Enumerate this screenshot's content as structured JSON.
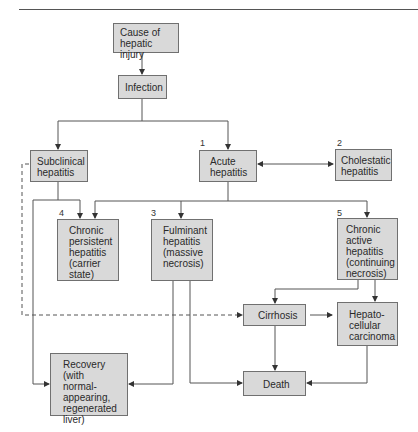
{
  "diagram": {
    "type": "flowchart",
    "colors": {
      "box_fill": "#d9d9d9",
      "box_border": "#707070",
      "line": "#555555"
    },
    "nodes": {
      "cause": {
        "label": "Cause of\nhepatic injury"
      },
      "infection": {
        "label": "Infection"
      },
      "subclinical": {
        "label": "Subclinical\nhepatitis"
      },
      "acute": {
        "label": "Acute\nhepatitis",
        "number": "1"
      },
      "cholestatic": {
        "label": "Cholestatic\nhepatitis",
        "number": "2"
      },
      "fulminant": {
        "label": "Fulminant\nhepatitis\n(massive\nnecrosis)",
        "number": "3"
      },
      "chronic_persistent": {
        "label": "Chronic\npersistent\nhepatitis\n(carrier\nstate)",
        "number": "4"
      },
      "chronic_active": {
        "label": "Chronic\nactive\nhepatitis\n(continuing\nnecrosis)",
        "number": "5"
      },
      "cirrhosis": {
        "label": "Cirrhosis"
      },
      "hcc": {
        "label": "Hepato-\ncellular\ncarcinoma"
      },
      "recovery": {
        "label": "Recovery\n(with normal-\nappearing,\nregenerated\nliver)"
      },
      "death": {
        "label": "Death"
      }
    },
    "edges": [
      {
        "from": "cause",
        "to": "infection"
      },
      {
        "from": "infection",
        "to": "subclinical"
      },
      {
        "from": "infection",
        "to": "acute"
      },
      {
        "from": "acute",
        "to": "cholestatic",
        "bidirectional": true
      },
      {
        "from": "acute",
        "to": "chronic_persistent"
      },
      {
        "from": "acute",
        "to": "fulminant"
      },
      {
        "from": "acute",
        "to": "chronic_active"
      },
      {
        "from": "subclinical",
        "to": "chronic_persistent"
      },
      {
        "from": "subclinical",
        "to": "recovery"
      },
      {
        "from": "subclinical",
        "to": "cirrhosis",
        "style": "dashed"
      },
      {
        "from": "fulminant",
        "to": "recovery"
      },
      {
        "from": "fulminant",
        "to": "death"
      },
      {
        "from": "chronic_active",
        "to": "cirrhosis"
      },
      {
        "from": "chronic_active",
        "to": "hcc"
      },
      {
        "from": "cirrhosis",
        "to": "hcc"
      },
      {
        "from": "cirrhosis",
        "to": "death"
      },
      {
        "from": "hcc",
        "to": "death"
      }
    ]
  }
}
